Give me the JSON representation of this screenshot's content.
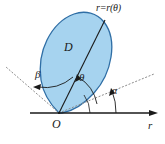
{
  "figure": {
    "kind": "polar-region-diagram",
    "background_color": "#ffffff",
    "labels": {
      "curve": "r=r(θ)",
      "region": "D",
      "theta": "θ",
      "beta": "β",
      "alpha": "α",
      "origin": "O",
      "r_axis": "r"
    },
    "colors": {
      "region_fill": "#a6d3ef",
      "region_stroke": "#2f6ea5",
      "line": "#1a1a1a",
      "dotted": "#8c8c8c",
      "text": "#1a1a1a"
    },
    "geometry": {
      "origin": [
        59,
        113
      ],
      "r_axis_end": [
        156,
        113
      ],
      "theta_ray_end": [
        112,
        23
      ],
      "alpha_ray_end": [
        152,
        76
      ],
      "beta_ray_end": [
        8,
        70
      ],
      "theta_arc_label_angle_deg": 62,
      "alpha_arc_label_angle_deg": 21,
      "beta_arc_label_angle_deg": 115
    }
  }
}
